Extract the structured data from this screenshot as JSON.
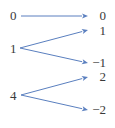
{
  "diagram": {
    "type": "mapping",
    "domain": [
      "0",
      "1",
      "4"
    ],
    "codomain": [
      "0",
      "1",
      "−1",
      "2",
      "−2"
    ],
    "arrows": [
      {
        "from": "0",
        "to": "0"
      },
      {
        "from": "1",
        "to": "1"
      },
      {
        "from": "1",
        "to": "−1"
      },
      {
        "from": "4",
        "to": "2"
      },
      {
        "from": "4",
        "to": "−2"
      }
    ],
    "colors": {
      "arrow": "#5a7fbf",
      "text": "#3a3a3a"
    }
  }
}
